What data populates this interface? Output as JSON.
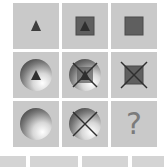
{
  "puzzle": {
    "rows": [
      [
        {
          "outer": "none",
          "inner": "triangle",
          "cross": false
        },
        {
          "outer": "square",
          "inner": "triangle",
          "cross": false
        },
        {
          "outer": "square",
          "inner": "none",
          "cross": false
        }
      ],
      [
        {
          "outer": "sphere",
          "inner": "triangle",
          "cross": false
        },
        {
          "outer": "sphere",
          "inner": "triangle-in-square",
          "cross": true
        },
        {
          "outer": "square",
          "inner": "none",
          "cross": true
        }
      ],
      [
        {
          "outer": "sphere",
          "inner": "none",
          "cross": false
        },
        {
          "outer": "sphere",
          "inner": "none",
          "cross": true
        },
        {
          "outer": "none",
          "inner": "question-mark",
          "cross": false
        }
      ]
    ],
    "missing_label": "?"
  },
  "colors": {
    "cell_bg": "#c9c9c9",
    "shape_dark": "#3d3d3d",
    "square_fill": "#5f5f5f",
    "question_mark": "#7b7b7b"
  }
}
